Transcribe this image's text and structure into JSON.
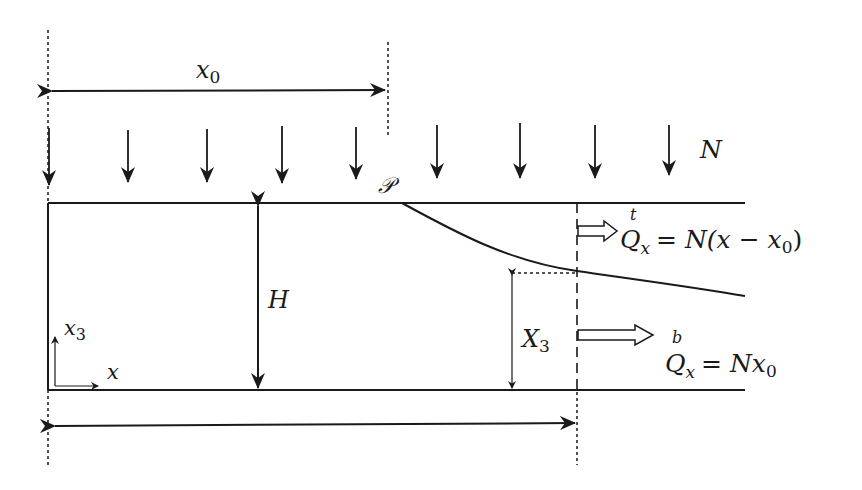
{
  "figure": {
    "type": "schematic diagram"
  },
  "labels": {
    "x0": "x",
    "x0_sub": "0",
    "N": "N",
    "P": "𝒫",
    "H": "H",
    "X3": "X",
    "X3_sub": "3",
    "x3_axis": "x",
    "x3_axis_sub": "3",
    "x_axis": "x",
    "Qt_sup": "t",
    "Qt_Q": "Q",
    "Qt_sub": "x",
    "Qt_rhs": "= N(x − x",
    "Qt_rhs_sub": "0",
    "Qt_close": ")",
    "Qb_sup": "b",
    "Qb_Q": "Q",
    "Qb_sub": "x",
    "Qb_rhs": "= Nx",
    "Qb_rhs_sub": "0"
  },
  "equations": {
    "top_flux": "Q^t_x = N(x − x0)",
    "bottom_flux": "Q^b_x = N x0"
  },
  "load_arrows": {
    "count": 9,
    "x_positions": [
      49,
      128,
      207,
      282,
      356,
      435,
      520,
      596,
      669
    ],
    "label": "N"
  },
  "colors": {
    "stroke": "#1a1a1a",
    "background": "#ffffff"
  }
}
